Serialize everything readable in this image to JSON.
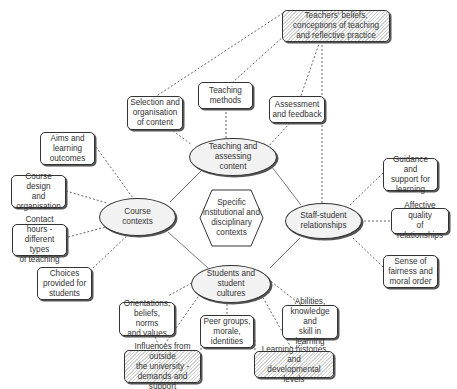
{
  "diagram": {
    "center": {
      "label": "Specific\ninstitutional and\ndisciplinary\ncontexts"
    },
    "hubs": {
      "teaching": "Teaching and\nassessing\ncontent",
      "course": "Course\ncontexts",
      "staff": "Staff-student\nrelationships",
      "students": "Students and\nstudent\ncultures"
    },
    "boxes": {
      "teachers_beliefs": "Teachers' beliefs,\nconceptions of teaching\nand reflective practice",
      "selection": "Selection and\norganisation\nof content",
      "teaching_methods": "Teaching\nmethods",
      "assessment": "Assessment\nand feedback",
      "aims": "Aims and\nlearning\noutcomes",
      "course_design": "Course design\nand\norganisation",
      "contact_hours": "Contact hours -\ndifferent types\nof teaching",
      "choices": "Choices\nprovided for\nstudents",
      "guidance": "Guidance and\nsupport for\nlearning",
      "affective": "Affective quality\nof relationships",
      "fairness": "Sense of\nfairness and\nmoral order",
      "orientations": "Orientations,\nbeliefs, norms\nand values",
      "peer_groups": "Peer groups,\nmorale,\nidentities",
      "abilities": "Abilities,\nknowledge and\nskill in learning",
      "influences": "Influences from outside\nthe university -\ndemands and support",
      "learning_histories": "Learning histories and\ndevelopmental levels"
    },
    "colors": {
      "line": "#555555",
      "ellipse_fill": "#f2f2f2",
      "hatch": "#cfcfcf"
    }
  }
}
